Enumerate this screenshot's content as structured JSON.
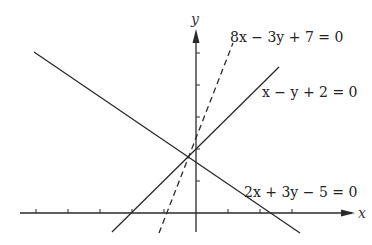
{
  "diagram": {
    "type": "coordinate-lines",
    "axes": {
      "x_label": "x",
      "y_label": "y",
      "origin_px": [
        196,
        213
      ],
      "unit_px": 32,
      "x_ticks": [
        -5,
        -4,
        -3,
        -2,
        -1,
        1,
        2,
        3
      ],
      "y_ticks": [
        1,
        2,
        3,
        4,
        5
      ]
    },
    "lines": [
      {
        "id": "line1",
        "equation": "8x − 3y + 7 = 0",
        "style": "dashed",
        "x1": 159,
        "y1": 233,
        "x2": 233,
        "y2": 43,
        "label_x": 230,
        "label_y": 42
      },
      {
        "id": "line2",
        "equation": "x − y + 2 = 0",
        "style": "solid",
        "x1": 112,
        "y1": 232,
        "x2": 279,
        "y2": 67,
        "label_x": 262,
        "label_y": 97
      },
      {
        "id": "line3",
        "equation": "2x + 3y − 5 = 0",
        "style": "solid",
        "x1": 34,
        "y1": 52,
        "x2": 300,
        "y2": 233,
        "label_x": 244,
        "label_y": 197
      }
    ],
    "colors": {
      "ink": "#2a2a2a",
      "background": "#ffffff"
    }
  }
}
